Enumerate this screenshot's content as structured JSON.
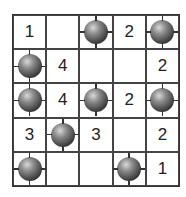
{
  "puzzle": {
    "rows": 5,
    "cols": 5,
    "cells": [
      [
        "1",
        "",
        "mine",
        "2",
        "mine"
      ],
      [
        "mine",
        "4",
        "",
        "",
        "2"
      ],
      [
        "mine",
        "4",
        "mine",
        "2",
        "mine"
      ],
      [
        "3",
        "mine",
        "3",
        "",
        "2"
      ],
      [
        "mine",
        "",
        "",
        "mine",
        "1"
      ]
    ]
  },
  "colors": {
    "grid_line": "#444444",
    "number": "#222222",
    "mine": "#3e3e3e"
  }
}
